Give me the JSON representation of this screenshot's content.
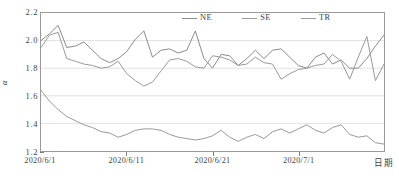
{
  "chart_data": {
    "type": "line",
    "title": "",
    "xlabel": "日期",
    "ylabel": "α",
    "ylim": [
      1.2,
      2.2
    ],
    "ytick_labels": [
      "2.2",
      "2.0",
      "1.8",
      "1.6",
      "1.4",
      "1.2"
    ],
    "ytick_values": [
      2.2,
      2.0,
      1.8,
      1.6,
      1.4,
      1.2
    ],
    "xtick_labels": [
      "2020/6/1",
      "2020/6/11",
      "2020/6/21",
      "2020/7/1"
    ],
    "xtick_indices": [
      0,
      10,
      20,
      30
    ],
    "grid": "horizontal",
    "legend_position": "top-center",
    "x": [
      "2020/6/1",
      "2020/6/2",
      "2020/6/3",
      "2020/6/4",
      "2020/6/5",
      "2020/6/6",
      "2020/6/7",
      "2020/6/8",
      "2020/6/9",
      "2020/6/10",
      "2020/6/11",
      "2020/6/12",
      "2020/6/13",
      "2020/6/14",
      "2020/6/15",
      "2020/6/16",
      "2020/6/17",
      "2020/6/18",
      "2020/6/19",
      "2020/6/20",
      "2020/6/21",
      "2020/6/22",
      "2020/6/23",
      "2020/6/24",
      "2020/6/25",
      "2020/6/26",
      "2020/6/27",
      "2020/6/28",
      "2020/6/29",
      "2020/6/30",
      "2020/7/1",
      "2020/7/2",
      "2020/7/3",
      "2020/7/4",
      "2020/7/5",
      "2020/7/6",
      "2020/7/7",
      "2020/7/8",
      "2020/7/9",
      "2020/7/10",
      "2020/7/11"
    ],
    "series": [
      {
        "name": "NE",
        "color": "#8c8c8c",
        "values": [
          2.0,
          2.05,
          2.11,
          1.95,
          1.96,
          1.99,
          1.93,
          1.87,
          1.84,
          1.87,
          1.92,
          2.01,
          2.07,
          1.88,
          1.93,
          1.94,
          1.91,
          1.93,
          2.07,
          1.87,
          1.8,
          1.9,
          1.89,
          1.82,
          1.87,
          1.93,
          1.87,
          1.93,
          1.94,
          1.88,
          1.82,
          1.8,
          1.88,
          1.91,
          1.83,
          1.86,
          1.8,
          1.8,
          1.87,
          1.96,
          2.04
        ]
      },
      {
        "name": "SE",
        "color": "#9a9a9a",
        "values": [
          1.95,
          2.04,
          2.06,
          1.87,
          1.85,
          1.83,
          1.82,
          1.8,
          1.81,
          1.85,
          1.76,
          1.71,
          1.67,
          1.7,
          1.78,
          1.86,
          1.87,
          1.85,
          1.81,
          1.8,
          1.89,
          1.88,
          1.86,
          1.82,
          1.83,
          1.88,
          1.84,
          1.83,
          1.72,
          1.76,
          1.79,
          1.8,
          1.82,
          1.83,
          1.9,
          1.85,
          1.72,
          1.88,
          2.03,
          1.71,
          1.83
        ]
      },
      {
        "name": "TR",
        "color": "#9a9a9a",
        "values": [
          1.64,
          1.56,
          1.5,
          1.45,
          1.42,
          1.39,
          1.37,
          1.34,
          1.33,
          1.3,
          1.32,
          1.35,
          1.36,
          1.36,
          1.35,
          1.32,
          1.3,
          1.29,
          1.28,
          1.29,
          1.31,
          1.35,
          1.3,
          1.27,
          1.3,
          1.32,
          1.29,
          1.34,
          1.36,
          1.33,
          1.36,
          1.39,
          1.35,
          1.33,
          1.37,
          1.39,
          1.32,
          1.3,
          1.31,
          1.26,
          1.25
        ]
      }
    ]
  },
  "legend": {
    "items": [
      {
        "label": "NE"
      },
      {
        "label": "SE"
      },
      {
        "label": "TR"
      }
    ]
  },
  "axes": {
    "y_title": "α",
    "x_title": "日期"
  }
}
